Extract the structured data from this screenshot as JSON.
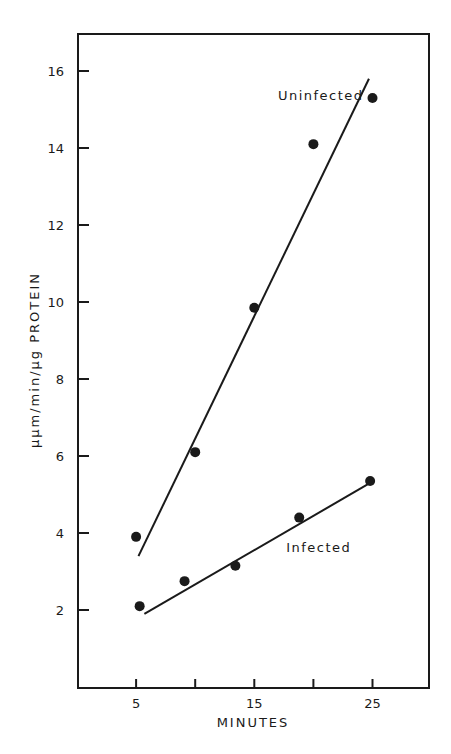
{
  "chart_data": {
    "type": "scatter",
    "title": "",
    "xlabel": "MINUTES",
    "ylabel": "μμm/min/μg PROTEIN",
    "xlim": [
      0,
      30
    ],
    "ylim": [
      0,
      17.5
    ],
    "x_ticks": [
      5,
      10,
      15,
      20,
      25
    ],
    "x_tick_labels": [
      "5",
      "",
      "15",
      "",
      "25"
    ],
    "y_ticks": [
      2,
      4,
      6,
      8,
      10,
      12,
      14,
      16
    ],
    "y_tick_labels": [
      "2",
      "4",
      "6",
      "8",
      "10",
      "12",
      "14",
      "16"
    ],
    "grid": false,
    "legend": "inline labels",
    "series": [
      {
        "name": "Uninfected",
        "points": [
          [
            5,
            3.9
          ],
          [
            10,
            6.1
          ],
          [
            15,
            9.85
          ],
          [
            20,
            14.1
          ],
          [
            25,
            15.3
          ]
        ],
        "fit_line": [
          [
            5.2,
            3.4
          ],
          [
            24.7,
            15.8
          ]
        ],
        "label_position": [
          17,
          15.25
        ]
      },
      {
        "name": "Infected",
        "points": [
          [
            5.3,
            2.1
          ],
          [
            9.1,
            2.75
          ],
          [
            13.4,
            3.15
          ],
          [
            18.8,
            4.4
          ],
          [
            24.8,
            5.35
          ]
        ],
        "fit_line": [
          [
            5.7,
            1.9
          ],
          [
            24.8,
            5.3
          ]
        ],
        "label_position": [
          17.7,
          3.5
        ]
      }
    ]
  },
  "colors": {
    "ink": "#1a1a1a",
    "background": "#ffffff"
  }
}
